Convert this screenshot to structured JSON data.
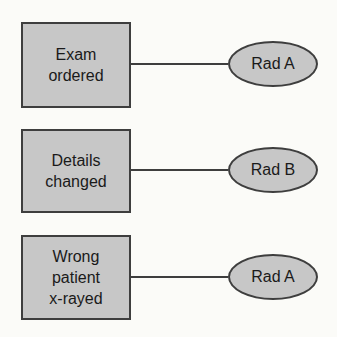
{
  "diagram": {
    "rows": [
      {
        "box_label": "Exam\nordered",
        "node_label": "Rad A"
      },
      {
        "box_label": "Details\nchanged",
        "node_label": "Rad B"
      },
      {
        "box_label": "Wrong\npatient\nx-rayed",
        "node_label": "Rad A"
      }
    ],
    "colors": {
      "shape_fill": "#c7c7c7",
      "shape_border": "#3e3e3e",
      "connector": "#3e3e3e",
      "text": "#1a1a1a",
      "background": "#fbfbf8"
    }
  }
}
